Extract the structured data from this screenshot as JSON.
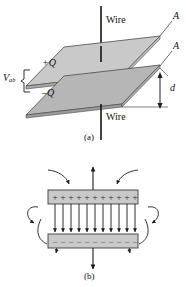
{
  "figure": {
    "background_color": "#ffffff",
    "ink_color": "#1a1a1a",
    "plate_fill_top": "#c8c8c8",
    "plate_fill_bottom": "#b4b4b4",
    "plate_fill_edge": "#9a9a9a",
    "plate_fill_flat": "#d0d0d0"
  },
  "panel_a": {
    "caption": "(a)",
    "wire_top_label": "Wire",
    "wire_bottom_label": "Wire",
    "charge_top_label": "+Q",
    "charge_bottom_label": "–Q",
    "area_label_top": "A",
    "area_label_bottom": "A",
    "separation_label": "d",
    "voltage_label_main": "V",
    "voltage_label_sub": "ab"
  },
  "panel_b": {
    "caption": "(b)",
    "plus_symbol": "+",
    "minus_symbol": "–",
    "plus_count": 11,
    "minus_count": 11,
    "interior_field_lines": 11,
    "fringe_curves_left": 3,
    "fringe_curves_right": 3,
    "center_arrow_top": "up",
    "center_arrow_bottom": "down",
    "field_direction": "downward from positive plate to negative plate"
  }
}
